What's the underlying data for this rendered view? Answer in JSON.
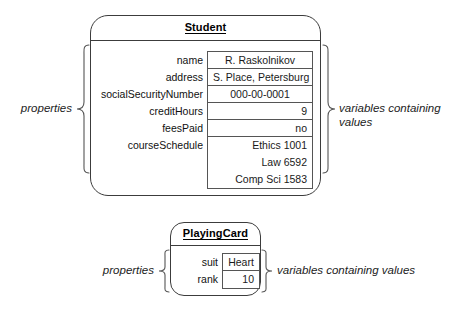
{
  "diagram": {
    "background": "#ffffff",
    "line_color": "#3c3c3c",
    "text_color": "#1a1a1a"
  },
  "objects": [
    {
      "id": "student",
      "name": "Student",
      "properties": [
        {
          "label": "name",
          "values": [
            "R. Raskolnikov"
          ],
          "align": "center"
        },
        {
          "label": "address",
          "values": [
            "S. Place, Petersburg"
          ],
          "align": "center"
        },
        {
          "label": "socialSecurityNumber",
          "values": [
            "000-00-0001"
          ],
          "align": "center"
        },
        {
          "label": "creditHours",
          "values": [
            "9"
          ],
          "align": "right"
        },
        {
          "label": "feesPaid",
          "values": [
            "no"
          ],
          "align": "right"
        },
        {
          "label": "courseSchedule",
          "values": [
            "Ethics 1001",
            "Law 6592",
            "Comp Sci 1583"
          ],
          "align": "right"
        }
      ],
      "annotation_left": "properties",
      "annotation_right": "variables containing\nvalues"
    },
    {
      "id": "playingcard",
      "name": "PlayingCard",
      "properties": [
        {
          "label": "suit",
          "values": [
            "Heart"
          ],
          "align": "center"
        },
        {
          "label": "rank",
          "values": [
            "10"
          ],
          "align": "right"
        }
      ],
      "annotation_left": "properties",
      "annotation_right": "variables containing values"
    }
  ]
}
